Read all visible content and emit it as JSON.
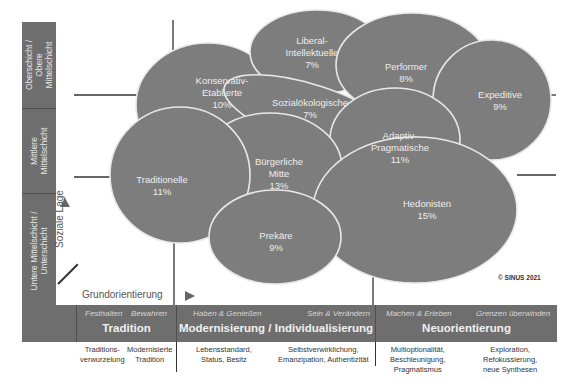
{
  "vertical_axis": {
    "label": "Soziale Lage",
    "levels": [
      {
        "label": "Oberschicht /\nObere\nMittelschicht"
      },
      {
        "label": "Mittlere\nMittelschicht"
      },
      {
        "label": "Untere Mittelschicht /\nUnterschicht"
      }
    ]
  },
  "horizontal_axis": {
    "label": "Grundorientierung",
    "sections": [
      {
        "title": "Tradition",
        "subs": [
          "Festhalten",
          "Bewahren"
        ],
        "descriptions": [
          "Traditions-\nverwurzelung",
          "Modernisierte\nTradition"
        ]
      },
      {
        "title": "Modernisierung / Individualisierung",
        "subs": [
          "Haben & Genießen",
          "Sein & Verändern"
        ],
        "descriptions": [
          "Lebensstandard,\nStatus, Besitz",
          "Selbstverwirklichung,\nEmanzipation, Authentizität"
        ]
      },
      {
        "title": "Neuorientierung",
        "subs": [
          "Machen & Erleben",
          "Grenzen überwinden"
        ],
        "descriptions": [
          "Multioptionalität,\nBeschleunigung,\nPragmatismus",
          "Exploration,\nRefokussierung,\nneue Synthesen"
        ]
      }
    ]
  },
  "milieus": [
    {
      "name": "Konservativ-\nEtablierte",
      "share": "10%"
    },
    {
      "name": "Liberal-\nIntellektuelle",
      "share": "7%"
    },
    {
      "name": "Performer",
      "share": "8%"
    },
    {
      "name": "Expeditive",
      "share": "9%"
    },
    {
      "name": "Sozialökologische",
      "share": "7%"
    },
    {
      "name": "Adaptiv-\nPragmatische",
      "share": "11%"
    },
    {
      "name": "Bürgerliche\nMitte",
      "share": "13%"
    },
    {
      "name": "Traditionelle",
      "share": "11%"
    },
    {
      "name": "Hedonisten",
      "share": "15%"
    },
    {
      "name": "Prekäre",
      "share": "9%"
    }
  ],
  "labels": {
    "konservativ": "Konservativ-\nEtablierte\n10%",
    "liberal": "Liberal-\nIntellektuelle\n7%",
    "performer": "Performer\n8%",
    "expeditive": "Expeditive\n9%",
    "sozial": "Sozialökologische\n7%",
    "adaptiv": "Adaptiv-\nPragmatische\n11%",
    "buergerlich": "Bürgerliche\nMitte\n13%",
    "traditionelle": "Traditionelle\n11%",
    "hedonisten": "Hedonisten\n15%",
    "prekaere": "Prekäre\n9%"
  },
  "copyright": "© SINUS 2021",
  "colors": {
    "panel": "#6e6e6e",
    "milieu_fill": "#7d7d7d",
    "overlap_fill": "#5e5e5e",
    "outline": "#e8e8e8"
  }
}
